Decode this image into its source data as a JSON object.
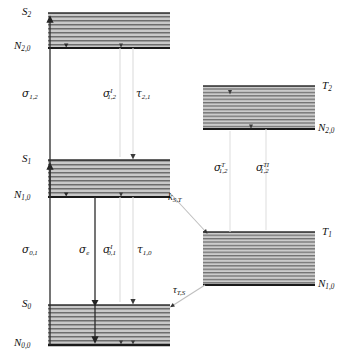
{
  "figure": {
    "type": "energy-level-diagram"
  },
  "bands": [
    {
      "id": "s2",
      "state_label": "S",
      "state_sub": "2",
      "level_label": "N",
      "level_sub": "2,0",
      "x": 48,
      "y": 13,
      "width": 122,
      "height": 35,
      "manifold": "singlet"
    },
    {
      "id": "s1",
      "state_label": "S",
      "state_sub": "1",
      "level_label": "N",
      "level_sub": "1,0",
      "x": 48,
      "y": 160,
      "width": 122,
      "height": 37,
      "manifold": "singlet"
    },
    {
      "id": "s0",
      "state_label": "S",
      "state_sub": "0",
      "level_label": "N",
      "level_sub": "0,0",
      "x": 48,
      "y": 305,
      "width": 122,
      "height": 40,
      "manifold": "singlet"
    },
    {
      "id": "t2",
      "state_label": "T",
      "state_sub": "2",
      "level_label": "N",
      "level_sub": "2,0",
      "x": 203,
      "y": 86,
      "width": 112,
      "height": 43,
      "manifold": "triplet"
    },
    {
      "id": "t1",
      "state_label": "T",
      "state_sub": "1",
      "level_label": "N",
      "level_sub": "1,0",
      "x": 203,
      "y": 232,
      "width": 112,
      "height": 53,
      "manifold": "triplet"
    }
  ],
  "transitions": [
    {
      "id": "sigma-0-1",
      "symbol": "σ",
      "sub": "0,1",
      "sup": "",
      "label_x": 22,
      "label_y": 250,
      "kind": "absorption-S0-to-S1",
      "direction": "up"
    },
    {
      "id": "sigma-1-2",
      "symbol": "σ",
      "sub": "1,2",
      "sup": "",
      "label_x": 22,
      "label_y": 94,
      "kind": "excited-state-absorption-S1-to-S2",
      "direction": "up"
    },
    {
      "id": "sigma-e",
      "symbol": "σ",
      "sub": "e",
      "sup": "",
      "label_x": 79,
      "label_y": 250,
      "kind": "stimulated-emission",
      "direction": "down"
    },
    {
      "id": "sigma-I-0-1",
      "symbol": "σ",
      "sub": "0,1",
      "sup": "I",
      "label_x": 105,
      "label_y": 250,
      "kind": "spontaneous-emission-S1-to-S0",
      "direction": "down"
    },
    {
      "id": "tau-1-0",
      "symbol": "τ",
      "sub": "1,0",
      "sup": "",
      "label_x": 139,
      "label_y": 250,
      "kind": "relaxation-S1-to-S0",
      "direction": "down"
    },
    {
      "id": "sigma-I-1-2",
      "symbol": "σ",
      "sub": "1,2",
      "sup": "I",
      "label_x": 104,
      "label_y": 94,
      "kind": "spontaneous-emission-S2-to-S1",
      "direction": "down"
    },
    {
      "id": "tau-2-1",
      "symbol": "τ",
      "sub": "2,1",
      "sup": "",
      "label_x": 138,
      "label_y": 94,
      "kind": "relaxation-S2-to-S1",
      "direction": "down"
    },
    {
      "id": "sigma-T-1-2",
      "symbol": "σ",
      "sub": "1,2",
      "sup": "T",
      "label_x": 215,
      "label_y": 168,
      "kind": "triplet-absorption-T1-to-T2",
      "direction": "up"
    },
    {
      "id": "sigma-TI-1-2",
      "symbol": "σ",
      "sub": "1,2",
      "sup": "TI",
      "label_x": 258,
      "label_y": 168,
      "kind": "triplet-emission-T2-to-T1",
      "direction": "down"
    },
    {
      "id": "k-S-T",
      "symbol": "k",
      "sub": "S,T",
      "sup": "",
      "label_x": 169,
      "label_y": 197,
      "kind": "intersystem-crossing-S1-to-T1",
      "direction": "diagonal-down-right"
    },
    {
      "id": "tau-T-S",
      "symbol": "τ",
      "sub": "T,S",
      "sup": "",
      "label_x": 174,
      "label_y": 290,
      "kind": "intersystem-crossing-T1-to-S0",
      "direction": "diagonal-down-left"
    }
  ],
  "colors": {
    "band_fill": "#bdbdbd",
    "band_line": "#3a3a3a",
    "baseline": "#1a1a1a",
    "arrow_dark": "#2b2b2b",
    "arrow_light": "#d6d6d6",
    "text": "#111111"
  }
}
